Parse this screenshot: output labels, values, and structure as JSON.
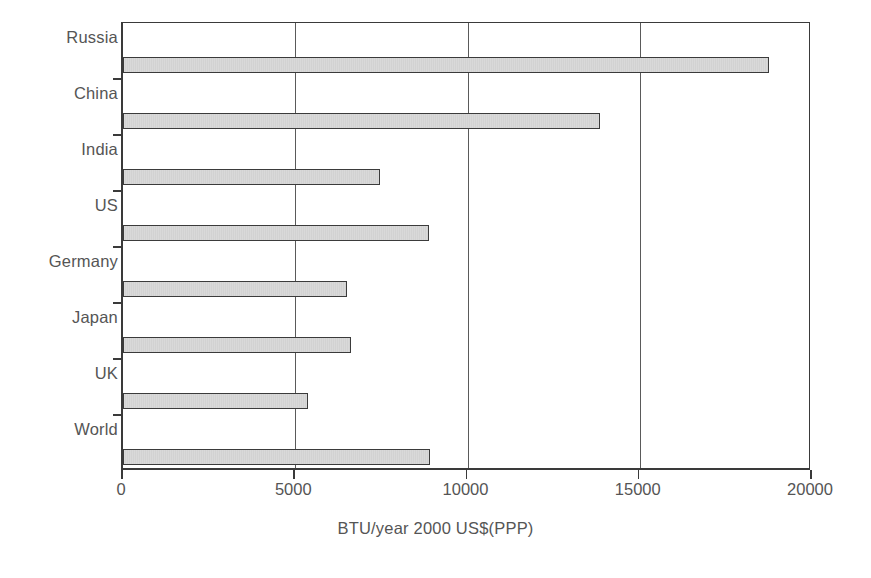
{
  "chart_data": {
    "type": "bar",
    "orientation": "horizontal",
    "title": "",
    "xlabel": "BTU/year 2000 US$(PPP)",
    "ylabel": "",
    "categories": [
      "Russia",
      "China",
      "India",
      "US",
      "Germany",
      "Japan",
      "UK",
      "World"
    ],
    "values": [
      18750,
      13840,
      7470,
      8890,
      6510,
      6620,
      5380,
      8910
    ],
    "xlim": [
      0,
      20000
    ],
    "xticks": [
      0,
      5000,
      10000,
      15000,
      20000
    ],
    "xtick_labels": [
      "0",
      "5000",
      "10000",
      "15000",
      "20000"
    ],
    "grid": "vertical",
    "legend": "none",
    "series": [
      {
        "name": "Energy intensity",
        "values": [
          18750,
          13840,
          7470,
          8890,
          6510,
          6620,
          5380,
          8910
        ]
      }
    ]
  },
  "style": {
    "bar_fill": "#d8d8d8",
    "bar_border": "#3b3b3b",
    "axis_color": "#3a3a3a",
    "grid_color": "#5a5a5a",
    "text_color": "#555555",
    "background": "#ffffff"
  }
}
